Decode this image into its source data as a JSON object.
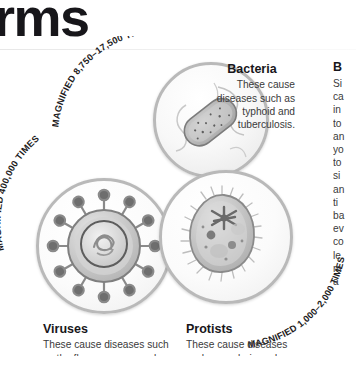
{
  "page": {
    "title_visible": "rms",
    "title_full": "Germs"
  },
  "figures": [
    {
      "id": "bacteria",
      "name": "Bacteria",
      "magnification_label": "MAGNIFIED 8,750–17,500 TIMES",
      "caption_heading": "Bacteria",
      "caption_body": "These cause diseases such as typhoid and tuberculosis.",
      "illustration": "rod-shaped-bacterium-with-flagella"
    },
    {
      "id": "viruses",
      "name": "Viruses",
      "magnification_label": "MAGNIFIED 400,000 TIMES",
      "caption_heading": "Viruses",
      "caption_body": "These cause diseases such",
      "caption_body_cut": "as the flu, mumps, measles,",
      "illustration": "spiked-virus-particle-with-core"
    },
    {
      "id": "protists",
      "name": "Protists",
      "magnification_label": "MAGNIFIED 1,000–2,000 TIMES",
      "caption_heading": "Protists",
      "caption_body": "These cause diseases",
      "caption_body_cut": "such as malaria and",
      "illustration": "ciliated-protozoan-paramecium"
    }
  ],
  "right_column": {
    "heading_visible": "B",
    "lines_visible": [
      "Si",
      "ca",
      "in",
      "to",
      "an",
      "yo",
      "to",
      "si",
      "an",
      "ti",
      "ba",
      "ev",
      "co",
      "le",
      "m",
      "a"
    ]
  },
  "colors": {
    "text": "#231f20",
    "heading": "#17161a",
    "body": "#3a3a3a",
    "circle_border": "#b9b9b9",
    "rule": "#e7e7e7"
  }
}
